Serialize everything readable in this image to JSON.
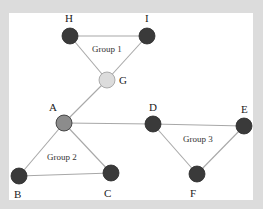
{
  "diagram": {
    "title": "",
    "colors": {
      "background": "#dcdcdc",
      "canvas": "#ffffff",
      "edge": "#a8a8a8",
      "node_dark": "#3a3a3a",
      "node_bridge_light": "#dcdcdc",
      "node_bridge_mid": "#8c8c8c"
    },
    "nodes": [
      {
        "id": "H",
        "label": "H",
        "style": "dark"
      },
      {
        "id": "I",
        "label": "I",
        "style": "dark"
      },
      {
        "id": "G",
        "label": "G",
        "style": "light"
      },
      {
        "id": "A",
        "label": "A",
        "style": "mid"
      },
      {
        "id": "D",
        "label": "D",
        "style": "dark"
      },
      {
        "id": "E",
        "label": "E",
        "style": "dark"
      },
      {
        "id": "B",
        "label": "B",
        "style": "dark"
      },
      {
        "id": "C",
        "label": "C",
        "style": "dark"
      },
      {
        "id": "F",
        "label": "F",
        "style": "dark"
      }
    ],
    "edges": [
      [
        "H",
        "I"
      ],
      [
        "H",
        "G"
      ],
      [
        "I",
        "G"
      ],
      [
        "G",
        "A"
      ],
      [
        "A",
        "B"
      ],
      [
        "A",
        "C"
      ],
      [
        "B",
        "C"
      ],
      [
        "A",
        "D"
      ],
      [
        "D",
        "E"
      ],
      [
        "D",
        "F"
      ],
      [
        "E",
        "F"
      ]
    ],
    "groups": [
      {
        "id": "group-1",
        "label": "Group 1",
        "members": [
          "H",
          "I",
          "G"
        ]
      },
      {
        "id": "group-2",
        "label": "Group 2",
        "members": [
          "A",
          "B",
          "C"
        ]
      },
      {
        "id": "group-3",
        "label": "Group 3",
        "members": [
          "D",
          "E",
          "F"
        ]
      }
    ]
  }
}
